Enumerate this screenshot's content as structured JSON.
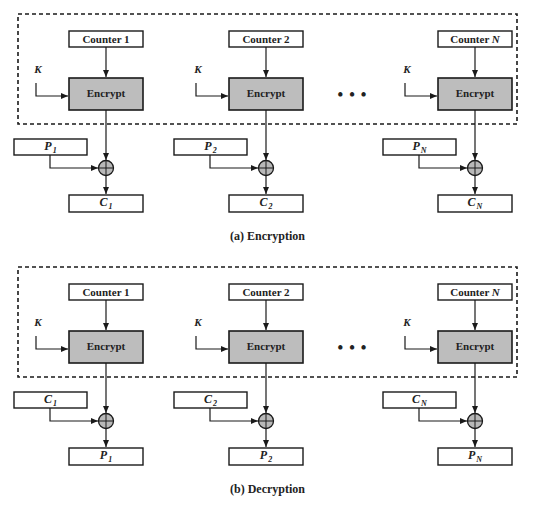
{
  "panels": [
    {
      "id": "encryption",
      "caption": "(a) Encryption",
      "y_offset": 0,
      "ellipsis": "•••",
      "columns": [
        {
          "counter": "Counter 1",
          "counter_label": "Counter",
          "counter_index": "1",
          "cipher": "Encrypt",
          "key": "K",
          "input_var": "P",
          "input_sub": "1",
          "output_var": "C",
          "output_sub": "1"
        },
        {
          "counter": "Counter 2",
          "counter_label": "Counter",
          "counter_index": "2",
          "cipher": "Encrypt",
          "key": "K",
          "input_var": "P",
          "input_sub": "2",
          "output_var": "C",
          "output_sub": "2"
        },
        {
          "counter": "Counter N",
          "counter_label": "Counter",
          "counter_index": "N",
          "cipher": "Encrypt",
          "key": "K",
          "input_var": "P",
          "input_sub": "N",
          "output_var": "C",
          "output_sub": "N"
        }
      ]
    },
    {
      "id": "decryption",
      "caption": "(b) Decryption",
      "y_offset": 253,
      "ellipsis": "•••",
      "columns": [
        {
          "counter": "Counter 1",
          "counter_label": "Counter",
          "counter_index": "1",
          "cipher": "Encrypt",
          "key": "K",
          "input_var": "C",
          "input_sub": "1",
          "output_var": "P",
          "output_sub": "1"
        },
        {
          "counter": "Counter 2",
          "counter_label": "Counter",
          "counter_index": "2",
          "cipher": "Encrypt",
          "key": "K",
          "input_var": "C",
          "input_sub": "2",
          "output_var": "P",
          "output_sub": "2"
        },
        {
          "counter": "Counter N",
          "counter_label": "Counter",
          "counter_index": "N",
          "cipher": "Encrypt",
          "key": "K",
          "input_var": "C",
          "input_sub": "N",
          "output_var": "P",
          "output_sub": "N"
        }
      ]
    }
  ],
  "colors": {
    "stroke": "#1a1a1a",
    "encrypt_fill": "#bdbdbd",
    "xor_fill": "#b8b8b8",
    "background": "#ffffff"
  }
}
